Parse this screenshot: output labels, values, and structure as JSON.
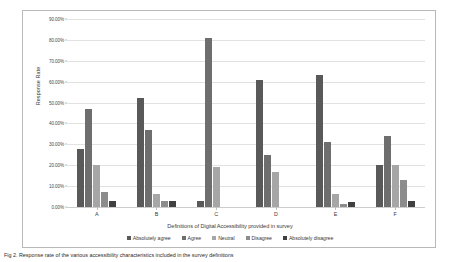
{
  "chart_data": {
    "type": "bar",
    "title": "",
    "xlabel": "Definitions of Digital Accessibility provided in survey",
    "ylabel": "Response Rate",
    "categories": [
      "A",
      "B",
      "C",
      "D",
      "E",
      "F"
    ],
    "ylim": [
      0,
      90
    ],
    "ytick_labels": [
      "90.00%",
      "80.00%",
      "70.00%",
      "60.00%",
      "50.00%",
      "40.00%",
      "30.00%",
      "20.00%",
      "10.00%",
      "0.00%"
    ],
    "ytick_values": [
      90,
      80,
      70,
      60,
      50,
      40,
      30,
      20,
      10,
      0
    ],
    "grid": true,
    "legend_position": "bottom",
    "series": [
      {
        "name": "Absolutely agree",
        "color": "#595959",
        "values": [
          28.0,
          52.0,
          3.0,
          61.0,
          63.0,
          20.0
        ]
      },
      {
        "name": "Agree",
        "color": "#6e6e6e",
        "values": [
          47.0,
          37.0,
          81.0,
          25.0,
          31.0,
          34.0
        ]
      },
      {
        "name": "Neutral",
        "color": "#a6a6a6",
        "values": [
          20.0,
          6.0,
          19.0,
          17.0,
          6.0,
          20.0
        ]
      },
      {
        "name": "Disagree",
        "color": "#8c8c8c",
        "values": [
          7.0,
          3.0,
          0.0,
          0.0,
          1.5,
          13.0
        ]
      },
      {
        "name": "Absolutely disagree",
        "color": "#404040",
        "values": [
          3.0,
          3.0,
          0.0,
          0.0,
          2.5,
          3.0
        ]
      }
    ]
  },
  "caption": {
    "text": "Fig 2. Response rate of the various accessibility characteristics included in the survey definitions"
  }
}
